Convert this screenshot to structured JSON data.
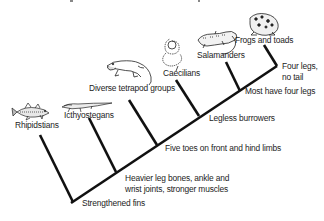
{
  "diagram": {
    "type": "cladogram",
    "taxa": [
      {
        "id": "rhipidstians",
        "label": "Rhipidstians",
        "icon": "fish-icon"
      },
      {
        "id": "icthyostegans",
        "label": "Icthyostegans",
        "icon": "early-tetrapod-icon"
      },
      {
        "id": "diverse",
        "label": "Diverse tetrapod groups",
        "icon": "lizard-like-tetrapod-icon"
      },
      {
        "id": "caecilians",
        "label": "Caecilians",
        "icon": "coiled-caecilian-icon"
      },
      {
        "id": "salamanders",
        "label": "Salamanders",
        "icon": "salamander-icon"
      },
      {
        "id": "frogs",
        "label": "Frogs and toads",
        "icon": "frog-icon"
      }
    ],
    "traits": [
      {
        "id": "fins",
        "label": "Strengthened fins"
      },
      {
        "id": "heavier",
        "label": "Heavier leg bones, ankle and\nwrist joints, stronger muscles"
      },
      {
        "id": "five_toes",
        "label": "Five toes on front and hind limbs"
      },
      {
        "id": "legless",
        "label": "Legless burrowers"
      },
      {
        "id": "most_four",
        "label": "Most have four legs"
      },
      {
        "id": "four_no_tail",
        "label": "Four legs,\nno tail"
      }
    ],
    "line_color": "#111111"
  }
}
